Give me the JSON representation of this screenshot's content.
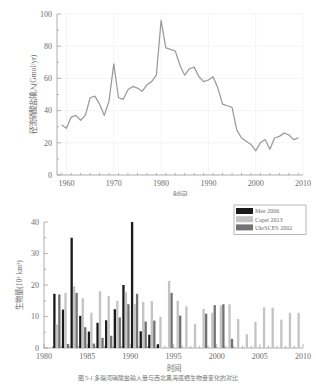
{
  "figure": {
    "caption": "图 5-1    多瑙河硝酸盐输入量与西北黑海底栖生物量变化的对比"
  },
  "chart_data": [
    {
      "id": "nitrate-runoff",
      "type": "line",
      "title": "",
      "xlabel": "时间",
      "ylabel": "径流硝酸盐输入(Gmol/yr)",
      "xlim": [
        1958,
        2010
      ],
      "ylim": [
        0,
        100
      ],
      "xticks": [
        1960,
        1970,
        1980,
        1990,
        2000,
        2010
      ],
      "yticks": [
        0,
        20,
        40,
        60,
        80,
        100
      ],
      "minor_xtick_step": 2,
      "minor_ytick_step": 10,
      "grid": true,
      "legend": "none",
      "line_color": "#9a9a9a",
      "x": [
        1959,
        1960,
        1961,
        1962,
        1963,
        1964,
        1965,
        1966,
        1967,
        1968,
        1969,
        1970,
        1971,
        1972,
        1973,
        1974,
        1975,
        1976,
        1977,
        1978,
        1979,
        1980,
        1981,
        1982,
        1983,
        1984,
        1985,
        1986,
        1987,
        1988,
        1989,
        1990,
        1991,
        1992,
        1993,
        1994,
        1995,
        1996,
        1997,
        1998,
        1999,
        2000,
        2001,
        2002,
        2003,
        2004,
        2005,
        2006,
        2007,
        2008,
        2009
      ],
      "y": [
        31,
        29,
        36,
        37,
        34,
        37,
        48,
        49,
        44,
        37,
        46,
        69,
        48,
        47,
        53,
        55,
        54,
        52,
        56,
        58,
        62,
        96,
        79,
        78,
        77,
        68,
        62,
        66,
        67,
        61,
        58,
        59,
        61,
        54,
        44,
        43,
        42,
        28,
        23,
        21,
        19,
        15,
        20,
        22,
        16,
        23,
        24,
        26,
        25,
        22,
        23
      ]
    },
    {
      "id": "benthic-biomass",
      "type": "bar",
      "title": "",
      "xlabel": "时间",
      "ylabel": "生物量(10³ km³)",
      "xlim": [
        1980,
        2010
      ],
      "ylim": [
        0,
        40
      ],
      "xticks": [
        1980,
        1985,
        1990,
        1995,
        2000,
        2005,
        2010
      ],
      "yticks": [
        0,
        10,
        20,
        30,
        40
      ],
      "minor_xtick_step": 1,
      "minor_ytick_step": 5,
      "grid": false,
      "legend_position": "top-right",
      "series": [
        {
          "name": "Mee 2006",
          "color": "#1a1a1a",
          "points": [
            {
              "x": 1981,
              "v": 17.2
            },
            {
              "x": 1982,
              "v": 12.2
            },
            {
              "x": 1983,
              "v": 35.0
            },
            {
              "x": 1984,
              "v": 10.2
            },
            {
              "x": 1985,
              "v": 5.2
            },
            {
              "x": 1986,
              "v": 8.0
            },
            {
              "x": 1987,
              "v": 8.8
            },
            {
              "x": 1988,
              "v": 12.3
            },
            {
              "x": 1989,
              "v": 20.0
            },
            {
              "x": 1990,
              "v": 40.0
            },
            {
              "x": 1991,
              "v": 5.3
            },
            {
              "x": 1992,
              "v": 4.2
            },
            {
              "x": 1993,
              "v": 1.2
            }
          ]
        },
        {
          "name": "Capet 2013",
          "color": "#c4c4c4",
          "points": [
            {
              "x": 1981,
              "v": 7.5
            },
            {
              "x": 1982,
              "v": 17.5
            },
            {
              "x": 1983,
              "v": 19.6
            },
            {
              "x": 1984,
              "v": 15.8
            },
            {
              "x": 1985,
              "v": 11.2
            },
            {
              "x": 1986,
              "v": 18.0
            },
            {
              "x": 1987,
              "v": 16.5
            },
            {
              "x": 1988,
              "v": 15.0
            },
            {
              "x": 1989,
              "v": 17.7
            },
            {
              "x": 1990,
              "v": 14.0
            },
            {
              "x": 1991,
              "v": 14.6
            },
            {
              "x": 1992,
              "v": 14.9
            },
            {
              "x": 1993,
              "v": 9.9
            },
            {
              "x": 1994,
              "v": 21.3
            },
            {
              "x": 1995,
              "v": 15.0
            },
            {
              "x": 1996,
              "v": 13.2
            },
            {
              "x": 1997,
              "v": 7.7
            },
            {
              "x": 1998,
              "v": 12.4
            },
            {
              "x": 1999,
              "v": 11.2
            },
            {
              "x": 2000,
              "v": 13.5
            },
            {
              "x": 2001,
              "v": 13.9
            },
            {
              "x": 2002,
              "v": 9.2
            },
            {
              "x": 2003,
              "v": 4.4
            },
            {
              "x": 2004,
              "v": 8.3
            },
            {
              "x": 2005,
              "v": 12.9
            },
            {
              "x": 2006,
              "v": 12.8
            },
            {
              "x": 2007,
              "v": 9.0
            },
            {
              "x": 2008,
              "v": 11.2
            },
            {
              "x": 2009,
              "v": 11.2
            }
          ]
        },
        {
          "name": "UkrSCES 2002",
          "color": "#737373",
          "points": [
            {
              "x": 1981,
              "v": 17.0
            },
            {
              "x": 1982,
              "v": 1.3
            },
            {
              "x": 1983,
              "v": 17.5
            },
            {
              "x": 1984,
              "v": 6.6
            },
            {
              "x": 1985,
              "v": 1.4
            },
            {
              "x": 1986,
              "v": 3.2
            },
            {
              "x": 1987,
              "v": 3.9
            },
            {
              "x": 1988,
              "v": 9.7
            },
            {
              "x": 1989,
              "v": 13.9
            },
            {
              "x": 1990,
              "v": 17.2
            },
            {
              "x": 1991,
              "v": 8.4
            },
            {
              "x": 1992,
              "v": 8.7
            },
            {
              "x": 1994,
              "v": 17.5
            },
            {
              "x": 1995,
              "v": 10.3
            },
            {
              "x": 1998,
              "v": 10.9
            },
            {
              "x": 1999,
              "v": 13.6
            },
            {
              "x": 2000,
              "v": 13.9
            },
            {
              "x": 2001,
              "v": 2.9
            }
          ]
        }
      ]
    }
  ]
}
